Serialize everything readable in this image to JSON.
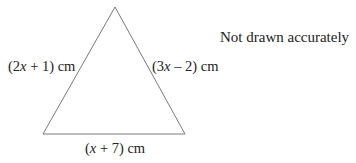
{
  "diagram": {
    "type": "triangle",
    "vertices": [
      [
        115,
        7
      ],
      [
        43,
        134
      ],
      [
        185,
        134
      ]
    ],
    "stroke_color": "#7a7a7a",
    "sides": {
      "left": {
        "open": "(2",
        "var": "x",
        "rest": " + 1) cm"
      },
      "right": {
        "open": "(3",
        "var": "x",
        "rest": " – 2) cm"
      },
      "bottom": {
        "open": "(",
        "var": "x",
        "rest": " + 7) cm"
      }
    },
    "note": "Not drawn accurately"
  }
}
